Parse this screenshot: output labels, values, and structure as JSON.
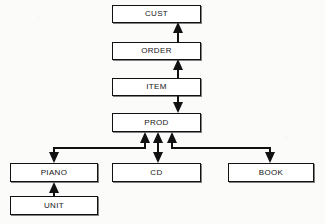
{
  "diagram": {
    "background_color": "#fbfbfa",
    "line_color": "#111111",
    "node_fill": "#ffffff",
    "nodes": [
      {
        "id": "cust",
        "label": "CUST",
        "x": 112,
        "y": 5,
        "w": 89,
        "h": 18
      },
      {
        "id": "order",
        "label": "ORDER",
        "x": 112,
        "y": 42,
        "w": 89,
        "h": 18
      },
      {
        "id": "item",
        "label": "ITEM",
        "x": 112,
        "y": 78,
        "w": 89,
        "h": 18
      },
      {
        "id": "prod",
        "label": "PROD",
        "x": 112,
        "y": 113,
        "w": 89,
        "h": 19
      },
      {
        "id": "piano",
        "label": "PIANO",
        "x": 10,
        "y": 163,
        "w": 88,
        "h": 19
      },
      {
        "id": "cd",
        "label": "CD",
        "x": 112,
        "y": 163,
        "w": 89,
        "h": 19
      },
      {
        "id": "book",
        "label": "BOOK",
        "x": 228,
        "y": 163,
        "w": 86,
        "h": 19
      },
      {
        "id": "unit",
        "label": "UNIT",
        "x": 10,
        "y": 196,
        "w": 88,
        "h": 19
      }
    ],
    "edges": [
      {
        "id": "order-to-cust",
        "from": "ORDER",
        "to": "CUST",
        "direction": "up",
        "style": "straight"
      },
      {
        "id": "item-to-order",
        "from": "ITEM",
        "to": "ORDER",
        "direction": "up",
        "style": "straight"
      },
      {
        "id": "item-to-prod",
        "from": "ITEM",
        "to": "PROD",
        "direction": "down",
        "style": "straight"
      },
      {
        "id": "prod-piano",
        "from": "PROD",
        "to": "PIANO",
        "direction": "bidirectional",
        "style": "elbow-left"
      },
      {
        "id": "prod-cd",
        "from": "PROD",
        "to": "CD",
        "direction": "bidirectional",
        "style": "straight"
      },
      {
        "id": "prod-book",
        "from": "PROD",
        "to": "BOOK",
        "direction": "bidirectional",
        "style": "elbow-right"
      },
      {
        "id": "unit-to-piano",
        "from": "UNIT",
        "to": "PIANO",
        "direction": "up",
        "style": "straight"
      }
    ]
  }
}
